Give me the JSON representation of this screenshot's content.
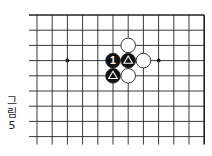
{
  "diagram": {
    "type": "go-board-fragment",
    "caption": [
      "그",
      "림",
      "5"
    ],
    "grid": {
      "origin_x": 37,
      "origin_y": 15,
      "spacing": 15.2,
      "columns": 12,
      "rows": 9,
      "top_edge": true,
      "right_edge": true
    },
    "colors": {
      "line": "#222222",
      "black": "#111111",
      "white": "#ffffff",
      "background": "#ffffff"
    },
    "hoshi": [
      {
        "col": 2,
        "row": 3
      },
      {
        "col": 8,
        "row": 3
      }
    ],
    "stones": [
      {
        "col": 6,
        "row": 2,
        "color": "white",
        "mark": ""
      },
      {
        "col": 5,
        "row": 3,
        "color": "black",
        "mark": "1"
      },
      {
        "col": 6,
        "row": 3,
        "color": "black",
        "mark": "triangle"
      },
      {
        "col": 7,
        "row": 3,
        "color": "white",
        "mark": ""
      },
      {
        "col": 5,
        "row": 4,
        "color": "black",
        "mark": "triangle"
      },
      {
        "col": 6,
        "row": 4,
        "color": "white",
        "mark": ""
      }
    ]
  }
}
